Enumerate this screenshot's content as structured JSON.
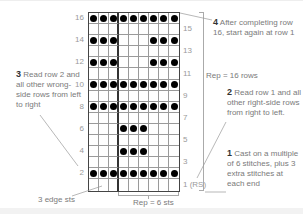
{
  "chart_data": {
    "type": "table",
    "columns": 9,
    "rows": 16,
    "edge_columns": 3,
    "repeat_columns": 6,
    "grid_rows_top_to_bottom": [
      {
        "row": 16,
        "filled": [
          1,
          1,
          1,
          1,
          1,
          1,
          1,
          1,
          1
        ]
      },
      {
        "row": 15,
        "filled": [
          0,
          0,
          0,
          0,
          0,
          0,
          0,
          0,
          0
        ]
      },
      {
        "row": 14,
        "filled": [
          1,
          1,
          1,
          0,
          0,
          0,
          1,
          1,
          1
        ]
      },
      {
        "row": 13,
        "filled": [
          0,
          0,
          0,
          0,
          0,
          0,
          0,
          0,
          0
        ]
      },
      {
        "row": 12,
        "filled": [
          1,
          1,
          1,
          0,
          0,
          0,
          1,
          1,
          1
        ]
      },
      {
        "row": 11,
        "filled": [
          0,
          0,
          0,
          0,
          0,
          0,
          0,
          0,
          0
        ]
      },
      {
        "row": 10,
        "filled": [
          1,
          1,
          1,
          1,
          1,
          1,
          1,
          1,
          1
        ]
      },
      {
        "row": 9,
        "filled": [
          0,
          0,
          0,
          0,
          0,
          0,
          0,
          0,
          0
        ]
      },
      {
        "row": 8,
        "filled": [
          1,
          1,
          1,
          1,
          1,
          1,
          1,
          1,
          1
        ]
      },
      {
        "row": 7,
        "filled": [
          0,
          0,
          0,
          0,
          0,
          0,
          0,
          0,
          0
        ]
      },
      {
        "row": 6,
        "filled": [
          0,
          0,
          0,
          1,
          1,
          1,
          0,
          0,
          0
        ]
      },
      {
        "row": 5,
        "filled": [
          0,
          0,
          0,
          0,
          0,
          0,
          0,
          0,
          0
        ]
      },
      {
        "row": 4,
        "filled": [
          0,
          0,
          0,
          1,
          1,
          1,
          0,
          0,
          0
        ]
      },
      {
        "row": 3,
        "filled": [
          0,
          0,
          0,
          0,
          0,
          0,
          0,
          0,
          0
        ]
      },
      {
        "row": 2,
        "filled": [
          1,
          1,
          1,
          1,
          1,
          1,
          1,
          1,
          1
        ]
      },
      {
        "row": 1,
        "filled": [
          0,
          0,
          0,
          0,
          0,
          0,
          0,
          0,
          0
        ]
      }
    ],
    "left_row_labels": [
      "16",
      "14",
      "12",
      "10",
      "8",
      "6",
      "4",
      "2"
    ],
    "right_row_labels": [
      "15",
      "13",
      "11",
      "9",
      "7",
      "5",
      "3",
      "1 (RS)"
    ]
  },
  "annotations": {
    "step1": {
      "num": "1",
      "text": "Cast on a multiple of 6 stitches, plus 3 extra stitches at each end"
    },
    "step2": {
      "num": "2",
      "text": "Read row 1 and all other right-side rows from right to left."
    },
    "step3": {
      "num": "3",
      "text": "Read row 2 and all other wrong-side rows from left to right"
    },
    "step4": {
      "num": "4",
      "text": "After completing row 16, start again at row 1"
    },
    "rep_rows": "Rep = 16 rows",
    "rep_sts": "Rep = 6 sts",
    "edge_sts": "3 edge sts"
  }
}
